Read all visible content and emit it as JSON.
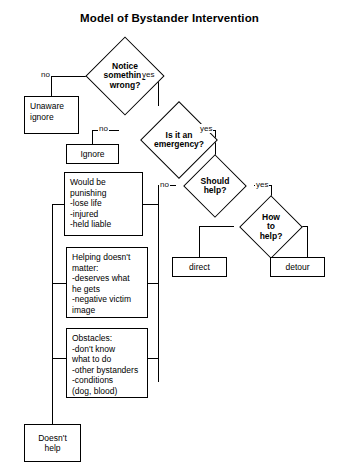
{
  "diagram": {
    "title": "Model of Bystander Intervention",
    "type": "flowchart",
    "nodes": {
      "notice": {
        "label": "Notice\nsomething\nwrong?",
        "shape": "diamond"
      },
      "unaware": {
        "label": "Unaware\nignore",
        "shape": "rectangle"
      },
      "emergency": {
        "label": "Is it an\nemergency?",
        "shape": "diamond"
      },
      "ignore": {
        "label": "Ignore",
        "shape": "rectangle"
      },
      "should_help": {
        "label": "Should\nhelp?",
        "shape": "diamond"
      },
      "how_to_help": {
        "label": "How\nto\nhelp?",
        "shape": "diamond"
      },
      "direct": {
        "label": "direct",
        "shape": "rectangle"
      },
      "detour": {
        "label": "detour",
        "shape": "rectangle"
      },
      "punishing": {
        "label": "Would be\npunishing\n  -lose life\n  -injured\n  -held liable",
        "shape": "rectangle"
      },
      "helping_no_matter": {
        "label": "Helping doesn't\nmatter:\n  -deserves what\n   he gets\n  -negative victim\n   image",
        "shape": "rectangle"
      },
      "obstacles": {
        "label": "Obstacles:\n  -don't know\n   what to do\n  -other bystanders\n  -conditions\n   (dog, blood)",
        "shape": "rectangle"
      },
      "doesnt_help": {
        "label": "Doesn't\nhelp",
        "shape": "rectangle"
      }
    },
    "edge_labels": {
      "notice_no": "no",
      "notice_yes": "yes",
      "emergency_no": "no",
      "emergency_yes": "yes",
      "should_help_no": "no",
      "should_help_yes": "yes"
    },
    "colors": {
      "stroke": "#000000",
      "background": "#ffffff",
      "text": "#000000"
    }
  }
}
